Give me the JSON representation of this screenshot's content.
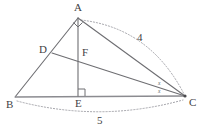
{
  "figure": {
    "type": "geometry-diagram",
    "background_color": "#ffffff",
    "line_color": "#6e6e72",
    "dotted_color": "#9a9aa0",
    "label_color": "#3f3f44"
  },
  "points": [
    {
      "id": "A",
      "label": "A",
      "x": 78,
      "y": 18,
      "label_x": 74,
      "label_y": 2
    },
    {
      "id": "B",
      "label": "B",
      "x": 15,
      "y": 97,
      "label_x": 6,
      "label_y": 99
    },
    {
      "id": "C",
      "label": "C",
      "x": 185,
      "y": 96,
      "label_x": 189,
      "label_y": 97
    },
    {
      "id": "D",
      "label": "D",
      "x": 52,
      "y": 53,
      "label_x": 39,
      "label_y": 44
    },
    {
      "id": "E",
      "label": "E",
      "x": 78,
      "y": 96,
      "label_x": 75,
      "label_y": 98
    },
    {
      "id": "F",
      "label": "F",
      "x": 78,
      "y": 58,
      "label_x": 82,
      "label_y": 47
    }
  ],
  "segments": [
    {
      "name": "segment-AB",
      "from": "A",
      "to": "B",
      "style": "solid"
    },
    {
      "name": "segment-AC",
      "from": "A",
      "to": "C",
      "style": "solid"
    },
    {
      "name": "segment-BC",
      "from": "B",
      "to": "C",
      "style": "baseline"
    },
    {
      "name": "segment-AE",
      "from": "A",
      "to": "E",
      "style": "solid"
    },
    {
      "name": "segment-DC",
      "from": "D",
      "to": "C",
      "style": "solid"
    }
  ],
  "angle_markers": [
    {
      "name": "right-angle-at-A",
      "at": "A",
      "kind": "right-angle-diamond"
    },
    {
      "name": "right-angle-at-E",
      "at": "E",
      "kind": "right-angle-square"
    },
    {
      "name": "angle-x-upper",
      "at": "C",
      "kind": "label",
      "label": "x",
      "x": 158,
      "y": 81
    },
    {
      "name": "angle-x-lower",
      "at": "C",
      "kind": "label",
      "label": "x",
      "x": 158,
      "y": 89
    }
  ],
  "measurements": [
    {
      "name": "length-AC",
      "label": "4",
      "from": "A",
      "to": "C",
      "label_x": 137,
      "label_y": 32,
      "arc": "above-right"
    },
    {
      "name": "length-BC",
      "label": "5",
      "from": "B",
      "to": "C",
      "label_x": 97,
      "label_y": 115,
      "arc": "below"
    }
  ]
}
